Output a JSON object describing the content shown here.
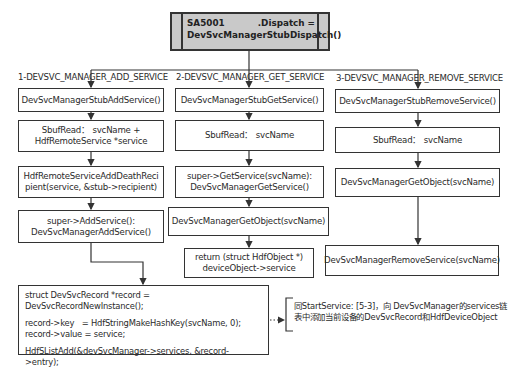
{
  "header": {
    "left": "SA5001",
    "right": ".Dispatch =",
    "line2": "DevSvcManagerStubDispatch()"
  },
  "branches": [
    {
      "label": "1-DEVSVC_MANAGER_ADD_SERVICE",
      "steps": [
        "DevSvcManagerStubAddService()",
        "SbufRead： svcName + HdfRemoteService *service",
        "HdfRemoteServiceAddDeathRecipient(service, &stub->recipient)",
        "super->AddService(): DevSvcManagerAddService()"
      ]
    },
    {
      "label": "2-DEVSVC_MANAGER_GET_SERVICE",
      "steps": [
        "DevSvcManagerStubGetService()",
        "SbufRead： svcName",
        "super->GetService(svcName): DevSvcManagerGetService()",
        "DevSvcManagerGetObject(svcName)",
        "return (struct HdfObject *) deviceObject->service"
      ]
    },
    {
      "label": "3-DEVSVC_MANAGER_REMOVE_SERVICE",
      "steps": [
        "DevSvcManagerStubRemoveService()",
        "SbufRead： svcName",
        "DevSvcManagerGetObject(svcName)",
        "DevSvcManagerRemoveService(svcName)"
      ]
    }
  ],
  "box_text": {
    "c1_1": "DevSvcManagerStubAddService()",
    "c1_2a": "SbufRead： svcName +",
    "c1_2b": "HdfRemoteService *service",
    "c1_3a": "HdfRemoteServiceAddDeathReci",
    "c1_3b": "pient(service, &stub->recipient)",
    "c1_4a": "super->AddService():",
    "c1_4b": "DevSvcManagerAddService()",
    "c2_1": "DevSvcManagerStubGetService()",
    "c2_2": "SbufRead： svcName",
    "c2_3a": "super->GetService(svcName):",
    "c2_3b": "DevSvcManagerGetService()",
    "c2_4": "DevSvcManagerGetObject(svcName)",
    "c2_5a": "return (struct HdfObject *)",
    "c2_5b": "deviceObject->service",
    "c3_1": "DevSvcManagerStubRemoveService()",
    "c3_2": "SbufRead： svcName",
    "c3_3": "DevSvcManagerGetObject(svcName)",
    "c3_4": "DevSvcManagerRemoveService(svcName)"
  },
  "code_box": {
    "line1": "struct DevSvcRecord *record = DevSvcRecordNewInstance();",
    "line2": "record->key   = HdfStringMakeHashKey(svcName, 0);",
    "line3": "record->value = service;",
    "line4": "HdfSListAdd(&devSvcManager->services, &record->entry);"
  },
  "note": {
    "line1": "同StartService: [5-3]，向 DevSvcManager的services链",
    "line2": "表中添加当前设备的DevSvcRecord和HdfDeviceObject"
  },
  "colors": {
    "line": "#333333",
    "header_fill": "#c9c9c9",
    "background": "#ffffff"
  }
}
